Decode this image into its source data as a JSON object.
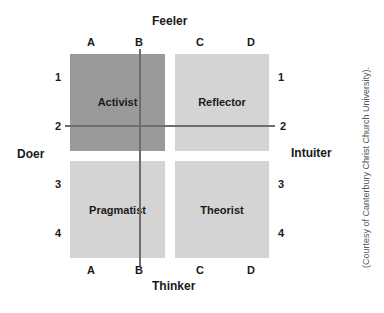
{
  "axes": {
    "top": "Feeler",
    "bottom": "Thinker",
    "left": "Doer",
    "right": "Intuiter"
  },
  "columns": [
    "A",
    "B",
    "C",
    "D"
  ],
  "rows": [
    "1",
    "2",
    "3",
    "4"
  ],
  "quadrants": [
    {
      "label": "Activist",
      "color": "#9a9a9a"
    },
    {
      "label": "Reflector",
      "color": "#d4d4d4"
    },
    {
      "label": "Pragmatist",
      "color": "#d4d4d4"
    },
    {
      "label": "Theorist",
      "color": "#d4d4d4"
    }
  ],
  "credit": "(Courtesy of Canterbury Christ Church University)."
}
